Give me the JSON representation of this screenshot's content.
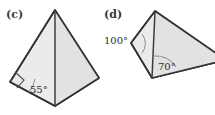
{
  "figures": [
    {
      "label": "(c)",
      "label_pos": {
        "x": 6,
        "y": 18
      },
      "shape": "kite-quadrilateral",
      "outline_points": "55,10 99,78 55,106 10,82",
      "shade_points": "55,10 99,78 55,106",
      "diagonal": {
        "x1": 55,
        "y1": 10,
        "x2": 55,
        "y2": 106
      },
      "angles": [
        {
          "name": "angle-55",
          "value": "55°",
          "text_pos": {
            "x": 30,
            "y": 93
          },
          "arc_path": "M 35,79 A 27,27 0 0 1 29,92",
          "vertex": {
            "x": 10,
            "y": 82
          }
        },
        {
          "name": "right-angle-marker",
          "value": "",
          "marker_path": "M 15,72 L 24,80 L 17,88",
          "vertex": {
            "x": 10,
            "y": 82
          }
        }
      ]
    },
    {
      "label": "(d)",
      "label_pos": {
        "x": 104,
        "y": 18
      },
      "shape": "kite-quadrilateral",
      "outline_points": "155,11 226,60 152,78 131,43",
      "shade_points": "155,11 226,60 152,78",
      "diagonal": {
        "x1": 155,
        "y1": 11,
        "x2": 152,
        "y2": 78
      },
      "angles": [
        {
          "name": "angle-100",
          "value": "100°",
          "text_pos": {
            "x": 104,
            "y": 44
          },
          "arc_path": "M 142,34 A 15,15 0 0 1 142,53",
          "vertex": {
            "x": 131,
            "y": 43
          }
        },
        {
          "name": "angle-70",
          "value": "70°",
          "text_pos": {
            "x": 158,
            "y": 70
          },
          "arc_path": "M 154,56 A 23,23 0 0 1 176,67",
          "vertex": {
            "x": 152,
            "y": 78
          }
        }
      ]
    }
  ],
  "colors": {
    "fill": "#ebebeb",
    "fill_shade": "#e2e2e2",
    "stroke": "#333333",
    "arc": "#8d8d8d",
    "text": "#2e2e2e",
    "background": "#ffffff"
  }
}
